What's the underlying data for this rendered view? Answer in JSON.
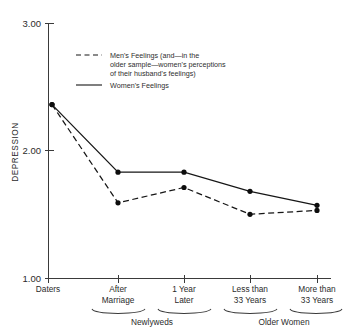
{
  "chart_data": {
    "type": "line",
    "title": "",
    "xlabel": "",
    "ylabel": "DEPRESSION",
    "ylim": [
      1.0,
      3.0
    ],
    "yticks": [
      "1.00",
      "2.00",
      "3.00"
    ],
    "ytick_values": [
      1.0,
      2.0,
      3.0
    ],
    "grid": false,
    "legend_position": "upper-center",
    "categories": [
      "Daters",
      "After Marriage",
      "1 Year Later",
      "Less than 33 Years",
      "More than 33 Years"
    ],
    "category_lines": [
      [
        "Daters"
      ],
      [
        "After",
        "Marriage"
      ],
      [
        "1 Year",
        "Later"
      ],
      [
        "Less than",
        "33 Years"
      ],
      [
        "More than",
        "33 Years"
      ]
    ],
    "groups": [
      {
        "label": "Newlyweds",
        "from": 1,
        "to": 2
      },
      {
        "label": "Older Women",
        "from": 3,
        "to": 4
      }
    ],
    "series": [
      {
        "name": "Men's Feelings (and—in the older sample—women's perceptions of their husband's feelings)",
        "style": "dashed",
        "values": [
          2.36,
          1.59,
          1.71,
          1.5,
          1.53
        ]
      },
      {
        "name": "Women's Feelings",
        "style": "solid",
        "values": [
          2.36,
          1.83,
          1.83,
          1.68,
          1.57
        ]
      }
    ]
  },
  "legend": {
    "entries": [
      {
        "style": "dashed",
        "line1": "Men's Feelings (and—in the",
        "line2": "older sample—women's perceptions",
        "line3": "of their husband's feelings)"
      },
      {
        "style": "solid",
        "line1": "Women's Feelings",
        "line2": "",
        "line3": ""
      }
    ]
  },
  "axis": {
    "y_title": "DEPRESSION",
    "y_top": "3.00",
    "y_mid": "2.00",
    "y_bottom": "1.00"
  },
  "xlabels": {
    "c0_l1": "Daters",
    "c1_l1": "After",
    "c1_l2": "Marriage",
    "c2_l1": "1 Year",
    "c2_l2": "Later",
    "c3_l1": "Less than",
    "c3_l2": "33 Years",
    "c4_l1": "More than",
    "c4_l2": "33 Years"
  },
  "groups": {
    "g0": "Newlyweds",
    "g1": "Older Women"
  },
  "colors": {
    "ink": "#161616",
    "axis": "#3a3a3a",
    "background": "#ffffff"
  }
}
